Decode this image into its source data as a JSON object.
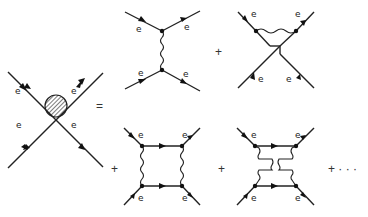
{
  "figure": {
    "particle_label": "e",
    "operators": {
      "equals": "=",
      "plus": "+",
      "ellipsis": "+ · · ·"
    },
    "diagrams": [
      {
        "id": "blob",
        "description": "Full 4-point vertex (hatched blob)",
        "labels": [
          "e",
          "e",
          "e",
          "e"
        ]
      },
      {
        "id": "tree-exchange",
        "description": "Single photon exchange (vertical wavy line)",
        "labels": [
          "e",
          "e",
          "e",
          "e"
        ]
      },
      {
        "id": "tree-crossed",
        "description": "Crossed single photon exchange",
        "labels": [
          "e",
          "e",
          "e",
          "e"
        ]
      },
      {
        "id": "box",
        "description": "Two-photon box diagram",
        "labels": [
          "e",
          "e",
          "e",
          "e"
        ]
      },
      {
        "id": "crossed-box",
        "description": "Crossed two-photon box diagram",
        "labels": [
          "e",
          "e",
          "e",
          "e"
        ]
      }
    ]
  }
}
